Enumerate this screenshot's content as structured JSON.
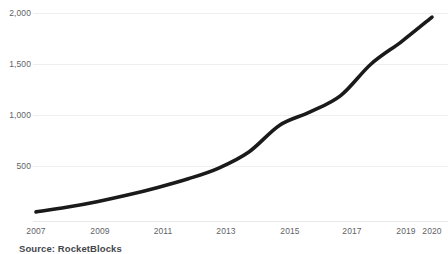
{
  "chart_data": {
    "type": "line",
    "title": "",
    "subtitle": "",
    "xlabel": "",
    "ylabel": "",
    "x": [
      2007,
      2008,
      2009,
      2010,
      2011,
      2012,
      2013,
      2014,
      2015,
      2016,
      2017,
      2018,
      2019,
      2020
    ],
    "values": [
      50,
      95,
      150,
      215,
      290,
      375,
      480,
      640,
      900,
      1030,
      1190,
      1500,
      1720,
      1960
    ],
    "series": [
      {
        "name": "Value",
        "values": [
          50,
          95,
          150,
          215,
          290,
          375,
          480,
          640,
          900,
          1030,
          1190,
          1500,
          1720,
          1960
        ]
      }
    ],
    "xlim": [
      2007,
      2020
    ],
    "ylim": [
      0,
      2100
    ],
    "x_tick_labels": [
      "2007",
      "2009",
      "2011",
      "2013",
      "2015",
      "2017",
      "2019",
      "2020"
    ],
    "x_tick_values": [
      2007,
      2009,
      2011,
      2013,
      2015,
      2017,
      2019,
      2020
    ],
    "y_tick_labels": [
      "2,000",
      "1,500",
      "1,000",
      "500"
    ],
    "y_tick_values": [
      2000,
      1500,
      1000,
      500
    ],
    "grid": "horizontal",
    "legend": "none",
    "line_color": "#1a1a1a",
    "grid_color": "#efeff1",
    "tick_label_color": "#5f6368",
    "background_color": "#ffffff"
  },
  "caption": {
    "source_text": "Source: RocketBlocks"
  }
}
